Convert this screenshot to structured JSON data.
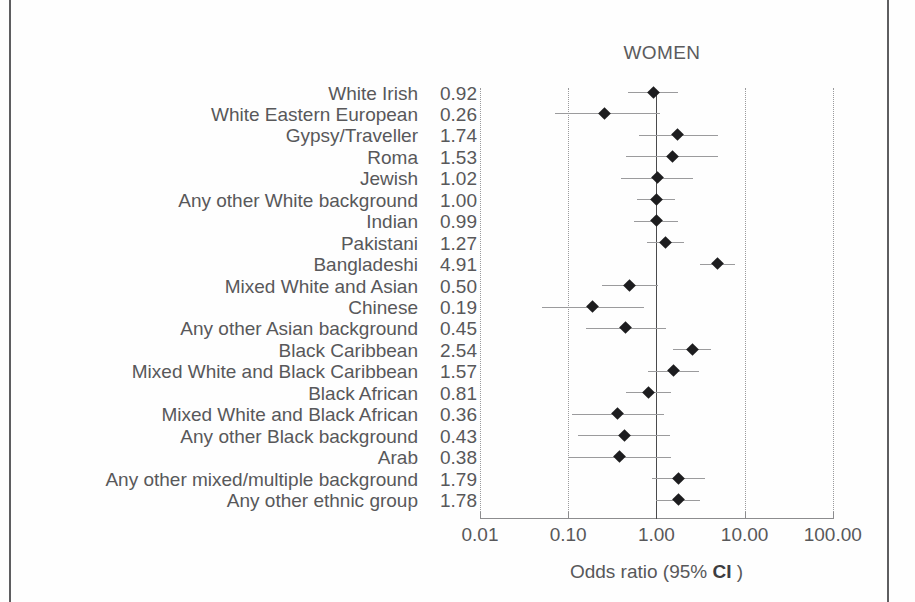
{
  "figure": {
    "title": "WOMEN",
    "axis_title_prefix": "Odds ratio (95% ",
    "axis_title_bold": "CI",
    "axis_title_suffix": " )",
    "value_separator": "."
  },
  "chart_data": {
    "type": "scatter",
    "subtype": "forest-plot",
    "title": "WOMEN",
    "xlabel": "Odds ratio (95% CI )",
    "ylabel": "",
    "xscale": "log",
    "xlim": [
      0.01,
      100.0
    ],
    "xticks": [
      0.01,
      0.1,
      1.0,
      10.0,
      100.0
    ],
    "xtick_labels": [
      "0.01",
      "0.10",
      "1.00",
      "10.00",
      "100.00"
    ],
    "reference_line": 1.0,
    "grid": "vertical-dotted",
    "legend": "none",
    "categories": [
      "White Irish",
      "White Eastern European",
      "Gypsy/Traveller",
      "Roma",
      "Jewish",
      "Any other White background",
      "Indian",
      "Pakistani",
      "Bangladeshi",
      "Mixed White and Asian",
      "Chinese",
      "Any other Asian background",
      "Black Caribbean",
      "Mixed White and Black Caribbean",
      "Black African",
      "Mixed White and Black African",
      "Any other Black background",
      "Arab",
      "Any other mixed/multiple background",
      "Any other ethnic group"
    ],
    "value_labels": [
      "0.92",
      "0.26",
      "1.74",
      "1.53",
      "1.02",
      "1.00",
      "0.99",
      "1.27",
      "4.91",
      "0.50",
      "0.19",
      "0.45",
      "2.54",
      "1.57",
      "0.81",
      "0.36",
      "0.43",
      "0.38",
      "1.79",
      "1.78"
    ],
    "values": [
      0.92,
      0.26,
      1.74,
      1.53,
      1.02,
      1.0,
      0.99,
      1.27,
      4.91,
      0.5,
      0.19,
      0.45,
      2.54,
      1.57,
      0.81,
      0.36,
      0.43,
      0.38,
      1.79,
      1.78
    ],
    "ci_low": [
      0.48,
      0.07,
      0.63,
      0.45,
      0.4,
      0.61,
      0.55,
      0.78,
      3.1,
      0.24,
      0.05,
      0.16,
      1.55,
      0.81,
      0.45,
      0.11,
      0.13,
      0.1,
      0.9,
      1.0
    ],
    "ci_high": [
      1.78,
      1.1,
      5.0,
      4.95,
      2.6,
      1.62,
      1.78,
      2.06,
      7.8,
      1.05,
      0.72,
      1.28,
      4.15,
      3.05,
      1.47,
      1.22,
      1.42,
      1.45,
      3.55,
      3.1
    ],
    "rows": [
      {
        "label": "White Irish",
        "value": 0.92,
        "value_label": "0.92",
        "ci_low": 0.48,
        "ci_high": 1.78
      },
      {
        "label": "White Eastern European",
        "value": 0.26,
        "value_label": "0.26",
        "ci_low": 0.07,
        "ci_high": 1.1
      },
      {
        "label": "Gypsy/Traveller",
        "value": 1.74,
        "value_label": "1.74",
        "ci_low": 0.63,
        "ci_high": 5.0
      },
      {
        "label": "Roma",
        "value": 1.53,
        "value_label": "1.53",
        "ci_low": 0.45,
        "ci_high": 4.95
      },
      {
        "label": "Jewish",
        "value": 1.02,
        "value_label": "1.02",
        "ci_low": 0.4,
        "ci_high": 2.6
      },
      {
        "label": "Any other White background",
        "value": 1.0,
        "value_label": "1.00",
        "ci_low": 0.61,
        "ci_high": 1.62
      },
      {
        "label": "Indian",
        "value": 0.99,
        "value_label": "0.99",
        "ci_low": 0.55,
        "ci_high": 1.78
      },
      {
        "label": "Pakistani",
        "value": 1.27,
        "value_label": "1.27",
        "ci_low": 0.78,
        "ci_high": 2.06
      },
      {
        "label": "Bangladeshi",
        "value": 4.91,
        "value_label": "4.91",
        "ci_low": 3.1,
        "ci_high": 7.8
      },
      {
        "label": "Mixed White and Asian",
        "value": 0.5,
        "value_label": "0.50",
        "ci_low": 0.24,
        "ci_high": 1.05
      },
      {
        "label": "Chinese",
        "value": 0.19,
        "value_label": "0.19",
        "ci_low": 0.05,
        "ci_high": 0.72
      },
      {
        "label": "Any other Asian background",
        "value": 0.45,
        "value_label": "0.45",
        "ci_low": 0.16,
        "ci_high": 1.28
      },
      {
        "label": "Black Caribbean",
        "value": 2.54,
        "value_label": "2.54",
        "ci_low": 1.55,
        "ci_high": 4.15
      },
      {
        "label": "Mixed White and Black Caribbean",
        "value": 1.57,
        "value_label": "1.57",
        "ci_low": 0.81,
        "ci_high": 3.05
      },
      {
        "label": "Black African",
        "value": 0.81,
        "value_label": "0.81",
        "ci_low": 0.45,
        "ci_high": 1.47
      },
      {
        "label": "Mixed White and Black African",
        "value": 0.36,
        "value_label": "0.36",
        "ci_low": 0.11,
        "ci_high": 1.22
      },
      {
        "label": "Any other Black background",
        "value": 0.43,
        "value_label": "0.43",
        "ci_low": 0.13,
        "ci_high": 1.42
      },
      {
        "label": "Arab",
        "value": 0.38,
        "value_label": "0.38",
        "ci_low": 0.1,
        "ci_high": 1.45
      },
      {
        "label": "Any other mixed/multiple background",
        "value": 1.79,
        "value_label": "1.79",
        "ci_low": 0.9,
        "ci_high": 3.55
      },
      {
        "label": "Any other ethnic group",
        "value": 1.78,
        "value_label": "1.78",
        "ci_low": 1.0,
        "ci_high": 3.1
      }
    ]
  }
}
